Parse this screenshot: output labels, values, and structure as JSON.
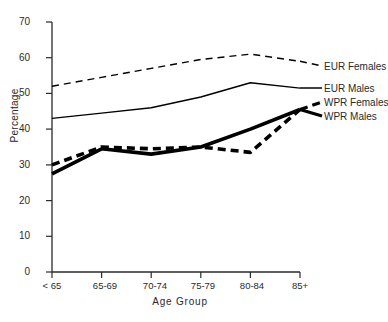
{
  "chart_data": {
    "type": "line",
    "title": "",
    "xlabel": "Age Group",
    "ylabel": "Percentage",
    "categories": [
      "< 65",
      "65-69",
      "70-74",
      "75-79",
      "80-84",
      "85+"
    ],
    "ylim": [
      0,
      70
    ],
    "yticks": [
      0,
      10,
      20,
      30,
      40,
      50,
      60,
      70
    ],
    "grid": false,
    "legend_position": "right",
    "series": [
      {
        "name": "EUR Females",
        "values": [
          52,
          54.5,
          57,
          59.5,
          61,
          59
        ],
        "style": "dashed",
        "width": "thin",
        "color": "#000000"
      },
      {
        "name": "EUR Males",
        "values": [
          43,
          44.5,
          46,
          49,
          53,
          51.5
        ],
        "style": "solid",
        "width": "thin",
        "color": "#000000"
      },
      {
        "name": "WPR Females",
        "values": [
          30,
          35,
          34.5,
          35,
          33.5,
          45.5
        ],
        "style": "dashed",
        "width": "thick",
        "color": "#000000"
      },
      {
        "name": "WPR Males",
        "values": [
          27.5,
          34.5,
          33,
          35,
          40,
          45.5
        ],
        "style": "solid",
        "width": "thick",
        "color": "#000000"
      }
    ]
  },
  "axes": {
    "y_title": "Percentage",
    "x_title": "Age Group",
    "y_tick_labels": [
      "0",
      "10",
      "20",
      "30",
      "40",
      "50",
      "60",
      "70"
    ],
    "x_tick_labels": [
      "< 65",
      "65-69",
      "70-74",
      "75-79",
      "80-84",
      "85+"
    ]
  },
  "legend": {
    "entries": [
      {
        "label": "EUR Females"
      },
      {
        "label": "EUR Males"
      },
      {
        "label": "WPR Females"
      },
      {
        "label": "WPR Males"
      }
    ]
  },
  "style": {
    "line_color": "#000000",
    "axis_color": "#2a2a2a",
    "background": "#ffffff"
  }
}
